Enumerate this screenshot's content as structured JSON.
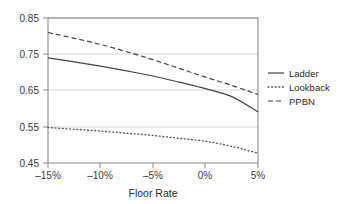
{
  "chart_data": {
    "type": "line",
    "title": "",
    "subtitle": "",
    "xlabel": "Floor Rate",
    "ylabel": "",
    "xlim": [
      -15,
      5
    ],
    "ylim": [
      0.45,
      0.85
    ],
    "grid": "horizontal",
    "legend_position": "right",
    "x_ticks": [
      -15,
      -10,
      -5,
      0,
      5
    ],
    "x_tick_labels": [
      "–15%",
      "–10%",
      "–5%",
      "0%",
      "5%"
    ],
    "y_ticks": [
      0.45,
      0.55,
      0.65,
      0.75,
      0.85
    ],
    "y_tick_labels": [
      "0.45",
      "0.55",
      "0.65",
      "0.75",
      "0.85"
    ],
    "x": [
      -15,
      -12.5,
      -10,
      -7.5,
      -5,
      -2.5,
      0,
      2.5,
      5
    ],
    "series": [
      {
        "name": "Ladder",
        "style": "solid",
        "color": "#444444",
        "values": [
          0.74,
          0.729,
          0.717,
          0.704,
          0.69,
          0.673,
          0.655,
          0.633,
          0.591
        ]
      },
      {
        "name": "Lookback",
        "style": "dotted",
        "color": "#555555",
        "values": [
          0.548,
          0.543,
          0.538,
          0.532,
          0.526,
          0.518,
          0.51,
          0.496,
          0.477
        ]
      },
      {
        "name": "PPBN",
        "style": "dashed",
        "color": "#444444",
        "values": [
          0.81,
          0.794,
          0.777,
          0.757,
          0.735,
          0.711,
          0.687,
          0.664,
          0.639
        ]
      }
    ]
  },
  "axes": {
    "x_label": "Floor Rate",
    "x_tick_0": "–15%",
    "x_tick_1": "–10%",
    "x_tick_2": "–5%",
    "x_tick_3": "0%",
    "x_tick_4": "5%",
    "y_tick_0": "0.45",
    "y_tick_1": "0.55",
    "y_tick_2": "0.65",
    "y_tick_3": "0.75",
    "y_tick_4": "0.85"
  },
  "legend": {
    "entries": [
      {
        "label": "Ladder"
      },
      {
        "label": "Lookback"
      },
      {
        "label": "PPBN"
      }
    ]
  },
  "colors": {
    "line": "#444444",
    "grid": "#c8c8c8",
    "axis": "#7a7a7a",
    "text": "#2b2b2b",
    "background": "#ffffff"
  }
}
